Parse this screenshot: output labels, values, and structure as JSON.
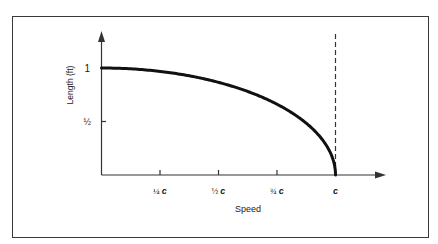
{
  "chart_data": {
    "type": "line",
    "title": "",
    "xlabel": "Speed",
    "ylabel": "Length (ft)",
    "x_ticks": [
      {
        "label": "¼ c",
        "value": 0.25
      },
      {
        "label": "½ c",
        "value": 0.5
      },
      {
        "label": "¾ c",
        "value": 0.75
      },
      {
        "label": "c",
        "value": 1.0
      }
    ],
    "y_ticks": [
      {
        "label": "½",
        "value": 0.5
      },
      {
        "label": "1",
        "value": 1.0
      }
    ],
    "xlim": [
      0,
      1.0
    ],
    "ylim": [
      0,
      1.0
    ],
    "grid": false,
    "legend": null,
    "series": [
      {
        "name": "Length vs speed (Lorentz contraction)",
        "x": [
          0,
          0.1,
          0.2,
          0.25,
          0.3,
          0.4,
          0.5,
          0.6,
          0.7,
          0.75,
          0.8,
          0.85,
          0.9,
          0.95,
          0.98,
          1.0
        ],
        "y": [
          1.0,
          0.995,
          0.98,
          0.968,
          0.954,
          0.917,
          0.866,
          0.8,
          0.714,
          0.661,
          0.6,
          0.527,
          0.436,
          0.312,
          0.199,
          0.0
        ]
      }
    ],
    "annotations": [
      {
        "type": "vertical-dashed-line",
        "x": 1.0,
        "label": "speed of light c"
      }
    ]
  },
  "axes": {
    "x_label": "Speed",
    "y_label": "Length (ft)",
    "y_tick_one": "1",
    "y_tick_half": "½",
    "x_tick_quarter": "¼",
    "x_tick_half": "½",
    "x_tick_three_quarter": "¾",
    "c_symbol": "c"
  },
  "colors": {
    "curve": "#111111",
    "axis": "#333333",
    "frame": "#3a3a3a"
  }
}
